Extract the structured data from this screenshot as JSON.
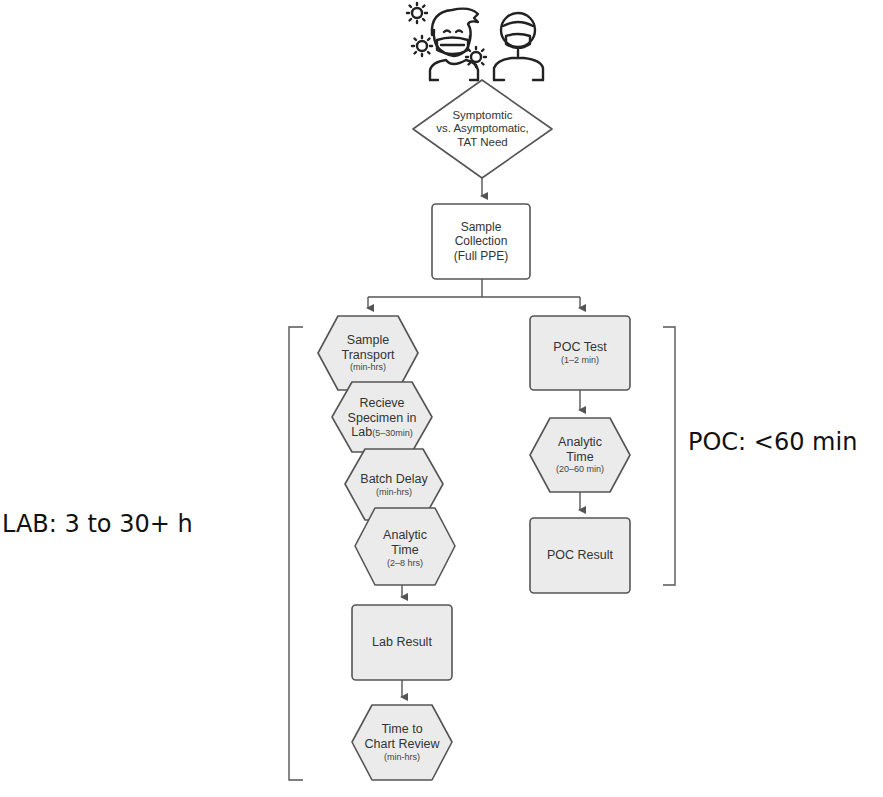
{
  "diagram": {
    "type": "flowchart",
    "icons": {
      "patients": "masked-people-with-virus-icon"
    },
    "decision": {
      "lines": [
        "Symptomtic",
        "vs. Asymptomatic,",
        "TAT Need"
      ]
    },
    "sample_collection": {
      "lines": [
        "Sample",
        "Collection",
        "(Full PPE)"
      ]
    },
    "lab_path": {
      "label": "LAB: 3 to 30+ h",
      "steps": [
        {
          "shape": "hexagon",
          "title_lines": [
            "Sample",
            "Transport"
          ],
          "detail": "(min-hrs)"
        },
        {
          "shape": "hexagon",
          "title_lines": [
            "Recieve",
            "Specimen in",
            "Lab"
          ],
          "detail": "(5–30min)"
        },
        {
          "shape": "hexagon",
          "title_lines": [
            "Batch Delay"
          ],
          "detail": "(min-hrs)"
        },
        {
          "shape": "hexagon",
          "title_lines": [
            "Analytic",
            "Time"
          ],
          "detail": "(2–8 hrs)"
        },
        {
          "shape": "rectangle",
          "title_lines": [
            "Lab Result"
          ],
          "detail": ""
        },
        {
          "shape": "hexagon",
          "title_lines": [
            "Time to",
            "Chart Review"
          ],
          "detail": "(min-hrs)"
        }
      ]
    },
    "poc_path": {
      "label": "POC: <60 min",
      "steps": [
        {
          "shape": "rectangle",
          "title_lines": [
            "POC Test"
          ],
          "detail": "(1–2 min)"
        },
        {
          "shape": "hexagon",
          "title_lines": [
            "Analytic",
            "Time"
          ],
          "detail": "(20–60 min)"
        },
        {
          "shape": "rectangle",
          "title_lines": [
            "POC Result"
          ],
          "detail": ""
        }
      ]
    },
    "colors": {
      "node_fill": "#ebebeb",
      "node_stroke": "#555555",
      "line": "#555555",
      "text": "#333333"
    }
  }
}
